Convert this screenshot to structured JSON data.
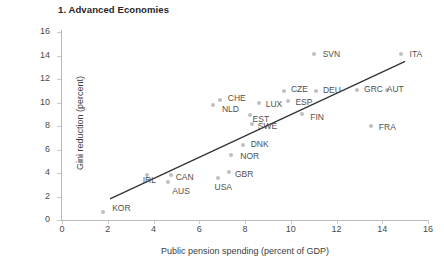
{
  "chart_data": {
    "type": "scatter",
    "title": "1. Advanced Economies",
    "xlabel": "Public pension spending (percent of GDP)",
    "ylabel": "Gini reduction (percent)",
    "xlim": [
      0,
      16
    ],
    "ylim": [
      0,
      16
    ],
    "xticks": [
      0,
      2,
      4,
      6,
      8,
      10,
      12,
      14,
      16
    ],
    "yticks": [
      0,
      2,
      4,
      6,
      8,
      10,
      12,
      14,
      16
    ],
    "grid": false,
    "legend": "none",
    "marker_color": "#bfbfbf",
    "trendline_color": "#333333",
    "points": [
      {
        "label": "KOR",
        "x": 1.8,
        "y": 0.7,
        "lx": 9,
        "ly": -4
      },
      {
        "label": "IRL",
        "x": 3.7,
        "y": 3.8,
        "lx": -4,
        "ly": 5
      },
      {
        "label": "AUS",
        "x": 4.65,
        "y": 3.2,
        "lx": 4,
        "ly": 9
      },
      {
        "label": "CAN",
        "x": 4.75,
        "y": 3.8,
        "lx": 5,
        "ly": 2
      },
      {
        "label": "USA",
        "x": 6.8,
        "y": 3.6,
        "lx": -3,
        "ly": 9
      },
      {
        "label": "GBR",
        "x": 7.3,
        "y": 4.1,
        "lx": 6,
        "ly": 2
      },
      {
        "label": "NOR",
        "x": 7.4,
        "y": 5.5,
        "lx": 9,
        "ly": 1
      },
      {
        "label": "DNK",
        "x": 7.9,
        "y": 6.4,
        "lx": 8,
        "ly": -1
      },
      {
        "label": "NLD",
        "x": 6.6,
        "y": 9.8,
        "lx": 9,
        "ly": 4
      },
      {
        "label": "CHE",
        "x": 6.9,
        "y": 10.2,
        "lx": 8,
        "ly": -2
      },
      {
        "label": "EST",
        "x": 8.2,
        "y": 8.9,
        "lx": 3,
        "ly": 4
      },
      {
        "label": "SWE",
        "x": 8.3,
        "y": 8.2,
        "lx": 6,
        "ly": 2
      },
      {
        "label": "LUX",
        "x": 8.6,
        "y": 10.0,
        "lx": 7,
        "ly": 1
      },
      {
        "label": "CZE",
        "x": 9.7,
        "y": 11.0,
        "lx": 7,
        "ly": -2
      },
      {
        "label": "ESP",
        "x": 9.9,
        "y": 10.1,
        "lx": 7,
        "ly": 1
      },
      {
        "label": "FIN",
        "x": 10.5,
        "y": 9.0,
        "lx": 8,
        "ly": 3
      },
      {
        "label": "DEU",
        "x": 11.1,
        "y": 11.0,
        "lx": 7,
        "ly": -1
      },
      {
        "label": "GRC",
        "x": 12.9,
        "y": 11.1,
        "lx": 7,
        "ly": -1
      },
      {
        "label": "AUT",
        "x": 14.2,
        "y": 11.1,
        "lx": 0,
        "ly": -1
      },
      {
        "label": "FRA",
        "x": 13.5,
        "y": 8.0,
        "lx": 8,
        "ly": 1
      },
      {
        "label": "SVN",
        "x": 11.0,
        "y": 14.1,
        "lx": 9,
        "ly": 0
      },
      {
        "label": "ITA",
        "x": 14.8,
        "y": 14.1,
        "lx": 9,
        "ly": 0
      }
    ],
    "trendline": {
      "x0": 2.1,
      "y0": 1.8,
      "x1": 15.0,
      "y1": 13.5
    }
  }
}
